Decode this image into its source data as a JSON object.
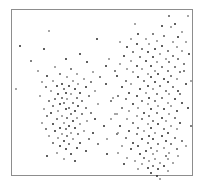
{
  "figure": {
    "title": "",
    "background_color": "#ffffff",
    "frame_color": "#8d8d8d",
    "marker_color_dark": "#2b2b2b",
    "marker_color_mid": "#585858",
    "marker_color_light": "#8a8a8a"
  },
  "chart_data": {
    "type": "scatter",
    "title": "",
    "subtitle": "",
    "xlabel": "",
    "ylabel": "",
    "xlim": [
      0,
      100
    ],
    "ylim": [
      0,
      100
    ],
    "grid": false,
    "legend": null,
    "xticks": [],
    "yticks": [],
    "annotations": [],
    "series": [
      {
        "name": "left-cluster",
        "marker": "dot",
        "color": "#2b2b2b",
        "n_points": 108,
        "center": [
          27.0,
          48.0
        ],
        "spread": [
          13.0,
          17.0
        ],
        "points": [
          [
            21.0,
            87.0
          ],
          [
            47.0,
            82.0
          ],
          [
            18.0,
            76.0
          ],
          [
            38.0,
            73.0
          ],
          [
            11.0,
            69.0
          ],
          [
            30.0,
            70.0
          ],
          [
            42.0,
            68.0
          ],
          [
            52.0,
            66.0
          ],
          [
            24.0,
            65.0
          ],
          [
            33.0,
            64.0
          ],
          [
            15.0,
            63.0
          ],
          [
            45.0,
            62.0
          ],
          [
            27.0,
            61.0
          ],
          [
            36.0,
            61.0
          ],
          [
            20.0,
            60.0
          ],
          [
            49.0,
            59.0
          ],
          [
            31.0,
            59.0
          ],
          [
            40.0,
            58.0
          ],
          [
            23.0,
            57.0
          ],
          [
            34.0,
            57.0
          ],
          [
            17.0,
            56.0
          ],
          [
            44.0,
            56.0
          ],
          [
            28.0,
            55.0
          ],
          [
            37.0,
            55.0
          ],
          [
            25.0,
            54.0
          ],
          [
            32.0,
            54.0
          ],
          [
            41.0,
            53.0
          ],
          [
            19.0,
            53.0
          ],
          [
            29.0,
            52.0
          ],
          [
            35.0,
            52.0
          ],
          [
            46.0,
            51.0
          ],
          [
            22.0,
            51.0
          ],
          [
            30.0,
            50.0
          ],
          [
            38.0,
            50.0
          ],
          [
            26.0,
            49.0
          ],
          [
            33.0,
            49.0
          ],
          [
            43.0,
            48.0
          ],
          [
            16.0,
            48.0
          ],
          [
            28.0,
            47.0
          ],
          [
            36.0,
            47.0
          ],
          [
            24.0,
            46.0
          ],
          [
            31.0,
            46.0
          ],
          [
            39.0,
            45.0
          ],
          [
            21.0,
            45.0
          ],
          [
            29.0,
            44.0
          ],
          [
            34.0,
            44.0
          ],
          [
            48.0,
            43.0
          ],
          [
            27.0,
            43.0
          ],
          [
            37.0,
            42.0
          ],
          [
            23.0,
            42.0
          ],
          [
            32.0,
            41.0
          ],
          [
            41.0,
            41.0
          ],
          [
            18.0,
            40.0
          ],
          [
            30.0,
            40.0
          ],
          [
            35.0,
            39.0
          ],
          [
            26.0,
            39.0
          ],
          [
            44.0,
            38.0
          ],
          [
            22.0,
            38.0
          ],
          [
            33.0,
            37.0
          ],
          [
            39.0,
            37.0
          ],
          [
            28.0,
            36.0
          ],
          [
            20.0,
            36.0
          ],
          [
            36.0,
            35.0
          ],
          [
            31.0,
            35.0
          ],
          [
            46.0,
            34.0
          ],
          [
            25.0,
            34.0
          ],
          [
            34.0,
            33.0
          ],
          [
            42.0,
            33.0
          ],
          [
            17.0,
            32.0
          ],
          [
            29.0,
            32.0
          ],
          [
            38.0,
            31.0
          ],
          [
            23.0,
            31.0
          ],
          [
            32.0,
            30.0
          ],
          [
            51.0,
            30.0
          ],
          [
            27.0,
            29.0
          ],
          [
            35.0,
            29.0
          ],
          [
            19.0,
            28.0
          ],
          [
            30.0,
            28.0
          ],
          [
            40.0,
            27.0
          ],
          [
            24.0,
            27.0
          ],
          [
            33.0,
            26.0
          ],
          [
            45.0,
            26.0
          ],
          [
            28.0,
            25.0
          ],
          [
            37.0,
            25.0
          ],
          [
            21.0,
            24.0
          ],
          [
            31.0,
            24.0
          ],
          [
            26.0,
            23.0
          ],
          [
            34.0,
            22.0
          ],
          [
            43.0,
            22.0
          ],
          [
            29.0,
            21.0
          ],
          [
            38.0,
            20.0
          ],
          [
            23.0,
            20.0
          ],
          [
            32.0,
            19.0
          ],
          [
            48.0,
            19.0
          ],
          [
            27.0,
            18.0
          ],
          [
            36.0,
            17.0
          ],
          [
            30.0,
            16.0
          ],
          [
            41.0,
            15.0
          ],
          [
            25.0,
            14.0
          ],
          [
            33.0,
            13.0
          ],
          [
            20.0,
            12.0
          ],
          [
            29.0,
            10.0
          ],
          [
            35.0,
            9.0
          ],
          [
            5.0,
            78.0
          ],
          [
            3.0,
            52.0
          ],
          [
            55.0,
            45.0
          ],
          [
            58.0,
            37.0
          ],
          [
            53.0,
            13.0
          ]
        ]
      },
      {
        "name": "right-cluster",
        "marker": "dot",
        "color": "#2b2b2b",
        "n_points": 182,
        "center": [
          76.0,
          52.0
        ],
        "spread": [
          11.0,
          21.0
        ],
        "points": [
          [
            87.0,
            96.0
          ],
          [
            97.0,
            96.0
          ],
          [
            88.0,
            89.0
          ],
          [
            70.0,
            85.0
          ],
          [
            78.0,
            85.0
          ],
          [
            84.0,
            84.0
          ],
          [
            92.0,
            83.0
          ],
          [
            66.0,
            82.0
          ],
          [
            74.0,
            82.0
          ],
          [
            80.0,
            81.0
          ],
          [
            89.0,
            80.0
          ],
          [
            96.0,
            80.0
          ],
          [
            69.0,
            79.0
          ],
          [
            76.0,
            79.0
          ],
          [
            83.0,
            78.0
          ],
          [
            91.0,
            77.0
          ],
          [
            64.0,
            77.0
          ],
          [
            72.0,
            76.0
          ],
          [
            79.0,
            76.0
          ],
          [
            86.0,
            75.0
          ],
          [
            94.0,
            75.0
          ],
          [
            67.0,
            74.0
          ],
          [
            75.0,
            74.0
          ],
          [
            82.0,
            73.0
          ],
          [
            89.0,
            72.0
          ],
          [
            62.0,
            72.0
          ],
          [
            71.0,
            71.0
          ],
          [
            78.0,
            71.0
          ],
          [
            85.0,
            70.0
          ],
          [
            92.0,
            70.0
          ],
          [
            66.0,
            69.0
          ],
          [
            74.0,
            69.0
          ],
          [
            80.0,
            68.0
          ],
          [
            87.0,
            68.0
          ],
          [
            95.0,
            67.0
          ],
          [
            60.0,
            67.0
          ],
          [
            69.0,
            66.0
          ],
          [
            77.0,
            66.0
          ],
          [
            83.0,
            65.0
          ],
          [
            90.0,
            65.0
          ],
          [
            64.0,
            64.0
          ],
          [
            72.0,
            64.0
          ],
          [
            79.0,
            63.0
          ],
          [
            86.0,
            63.0
          ],
          [
            93.0,
            62.0
          ],
          [
            67.0,
            62.0
          ],
          [
            75.0,
            61.0
          ],
          [
            81.0,
            61.0
          ],
          [
            88.0,
            60.0
          ],
          [
            58.0,
            60.0
          ],
          [
            70.0,
            59.0
          ],
          [
            77.0,
            59.0
          ],
          [
            84.0,
            58.0
          ],
          [
            91.0,
            58.0
          ],
          [
            63.0,
            57.0
          ],
          [
            73.0,
            57.0
          ],
          [
            79.0,
            56.0
          ],
          [
            86.0,
            56.0
          ],
          [
            96.0,
            55.0
          ],
          [
            66.0,
            55.0
          ],
          [
            75.0,
            54.0
          ],
          [
            82.0,
            54.0
          ],
          [
            89.0,
            53.0
          ],
          [
            61.0,
            53.0
          ],
          [
            71.0,
            52.0
          ],
          [
            78.0,
            52.0
          ],
          [
            85.0,
            51.0
          ],
          [
            92.0,
            51.0
          ],
          [
            65.0,
            50.0
          ],
          [
            74.0,
            50.0
          ],
          [
            80.0,
            49.0
          ],
          [
            87.0,
            49.0
          ],
          [
            59.0,
            48.0
          ],
          [
            69.0,
            48.0
          ],
          [
            76.0,
            47.0
          ],
          [
            83.0,
            47.0
          ],
          [
            90.0,
            46.0
          ],
          [
            63.0,
            46.0
          ],
          [
            72.0,
            45.0
          ],
          [
            79.0,
            45.0
          ],
          [
            86.0,
            44.0
          ],
          [
            94.0,
            44.0
          ],
          [
            67.0,
            43.0
          ],
          [
            75.0,
            43.0
          ],
          [
            81.0,
            42.0
          ],
          [
            88.0,
            42.0
          ],
          [
            61.0,
            41.0
          ],
          [
            70.0,
            41.0
          ],
          [
            77.0,
            40.0
          ],
          [
            84.0,
            40.0
          ],
          [
            91.0,
            39.0
          ],
          [
            65.0,
            39.0
          ],
          [
            73.0,
            38.0
          ],
          [
            80.0,
            38.0
          ],
          [
            87.0,
            37.0
          ],
          [
            57.0,
            37.0
          ],
          [
            69.0,
            36.0
          ],
          [
            76.0,
            36.0
          ],
          [
            83.0,
            35.0
          ],
          [
            90.0,
            35.0
          ],
          [
            64.0,
            34.0
          ],
          [
            72.0,
            34.0
          ],
          [
            78.0,
            33.0
          ],
          [
            85.0,
            33.0
          ],
          [
            93.0,
            32.0
          ],
          [
            67.0,
            32.0
          ],
          [
            75.0,
            31.0
          ],
          [
            81.0,
            31.0
          ],
          [
            88.0,
            30.0
          ],
          [
            60.0,
            30.0
          ],
          [
            70.0,
            29.0
          ],
          [
            77.0,
            29.0
          ],
          [
            84.0,
            28.0
          ],
          [
            91.0,
            28.0
          ],
          [
            65.0,
            27.0
          ],
          [
            73.0,
            27.0
          ],
          [
            79.0,
            26.0
          ],
          [
            86.0,
            26.0
          ],
          [
            58.0,
            25.0
          ],
          [
            69.0,
            25.0
          ],
          [
            76.0,
            24.0
          ],
          [
            83.0,
            24.0
          ],
          [
            90.0,
            23.0
          ],
          [
            63.0,
            23.0
          ],
          [
            72.0,
            22.0
          ],
          [
            78.0,
            22.0
          ],
          [
            85.0,
            21.0
          ],
          [
            94.0,
            21.0
          ],
          [
            67.0,
            20.0
          ],
          [
            75.0,
            20.0
          ],
          [
            81.0,
            19.0
          ],
          [
            88.0,
            19.0
          ],
          [
            61.0,
            18.0
          ],
          [
            70.0,
            18.0
          ],
          [
            77.0,
            17.0
          ],
          [
            84.0,
            17.0
          ],
          [
            91.0,
            16.0
          ],
          [
            66.0,
            16.0
          ],
          [
            74.0,
            15.0
          ],
          [
            80.0,
            15.0
          ],
          [
            87.0,
            14.0
          ],
          [
            59.0,
            14.0
          ],
          [
            71.0,
            13.0
          ],
          [
            78.0,
            13.0
          ],
          [
            85.0,
            12.0
          ],
          [
            92.0,
            12.0
          ],
          [
            64.0,
            11.0
          ],
          [
            73.0,
            11.0
          ],
          [
            79.0,
            10.0
          ],
          [
            86.0,
            10.0
          ],
          [
            68.0,
            9.0
          ],
          [
            76.0,
            9.0
          ],
          [
            82.0,
            8.0
          ],
          [
            89.0,
            8.0
          ],
          [
            62.0,
            7.0
          ],
          [
            72.0,
            7.0
          ],
          [
            78.0,
            6.0
          ],
          [
            84.0,
            6.0
          ],
          [
            75.0,
            5.0
          ],
          [
            81.0,
            4.0
          ],
          [
            70.0,
            4.0
          ],
          [
            86.0,
            3.0
          ],
          [
            77.0,
            2.0
          ],
          [
            98.0,
            73.0
          ],
          [
            99.0,
            57.0
          ],
          [
            97.0,
            41.0
          ],
          [
            99.0,
            30.0
          ],
          [
            96.0,
            18.0
          ],
          [
            54.0,
            70.0
          ],
          [
            52.0,
            55.0
          ],
          [
            55.0,
            34.0
          ],
          [
            53.0,
            22.0
          ],
          [
            83.0,
            90.0
          ],
          [
            90.0,
            91.0
          ],
          [
            68.0,
            91.0
          ],
          [
            94.0,
            86.0
          ],
          [
            60.0,
            80.0
          ],
          [
            57.0,
            63.0
          ],
          [
            56.0,
            47.0
          ],
          [
            59.0,
            26.0
          ],
          [
            95.0,
            63.0
          ],
          [
            93.0,
            49.0
          ],
          [
            82.0,
            -2.0
          ],
          [
            80.0,
            0.0
          ]
        ]
      }
    ]
  }
}
